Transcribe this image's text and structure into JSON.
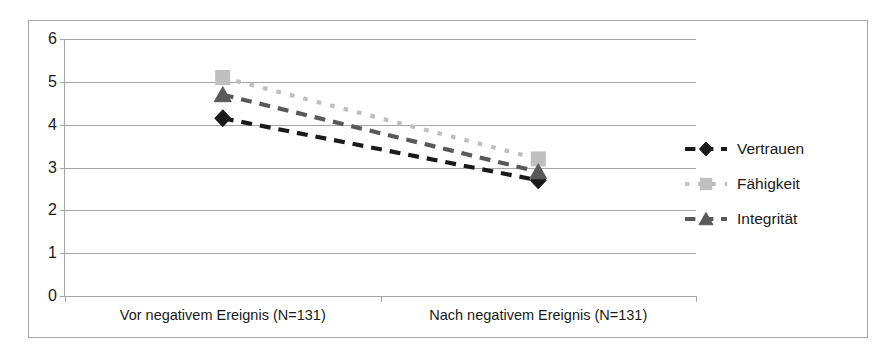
{
  "chart_data": {
    "type": "line",
    "title": "",
    "subtitle": "",
    "xlabel": "",
    "ylabel": "",
    "ylim": [
      0,
      6
    ],
    "yticks": [
      "0",
      "1",
      "2",
      "3",
      "4",
      "5",
      "6"
    ],
    "grid": true,
    "legend_position": "right",
    "categories": [
      "Vor negativem Ereignis (N=131)",
      "Nach negativem Ereignis (N=131)"
    ],
    "series": [
      {
        "name": "Vertrauen",
        "values": [
          4.15,
          2.7
        ],
        "marker": "diamond",
        "color": "#1a1a1a",
        "line_style": "dashed"
      },
      {
        "name": "Fähigkeit",
        "values": [
          5.1,
          3.2
        ],
        "marker": "square",
        "color": "#bfbfbf",
        "line_style": "dotted"
      },
      {
        "name": "Integrität",
        "values": [
          4.7,
          2.9
        ],
        "marker": "triangle",
        "color": "#595959",
        "line_style": "dashed"
      }
    ]
  },
  "axes": {
    "y_tick_labels": [
      "6",
      "5",
      "4",
      "3",
      "2",
      "1",
      "0"
    ],
    "x_tick_labels": [
      "Vor negativem Ereignis (N=131)",
      "Nach negativem Ereignis (N=131)"
    ]
  },
  "legend": {
    "items": [
      {
        "label": "Vertrauen"
      },
      {
        "label": "Fähigkeit"
      },
      {
        "label": "Integrität"
      }
    ]
  },
  "colors": {
    "grid": "#a6a6a6",
    "frame": "#a6a6a6",
    "text": "#1a1a1a",
    "series_vertrauen": "#1a1a1a",
    "series_faehigkeit": "#bfbfbf",
    "series_integritaet": "#595959",
    "background": "#ffffff"
  }
}
